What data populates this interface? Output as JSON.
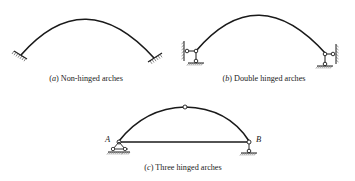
{
  "figures": [
    {
      "id": "a",
      "letter": "a",
      "title": "Non-hinged arches",
      "supports": "fixed"
    },
    {
      "id": "b",
      "letter": "b",
      "title": "Double hinged arches",
      "supports": "hinged"
    },
    {
      "id": "c",
      "letter": "c",
      "title": "Three hinged arches",
      "supports": "pin-and-roller with crown hinge and tie",
      "points": {
        "left": "A",
        "right": "B"
      }
    }
  ],
  "colors": {
    "line": "#1a1a1a",
    "hatch": "#555555",
    "text": "#222222",
    "background": "#ffffff"
  }
}
